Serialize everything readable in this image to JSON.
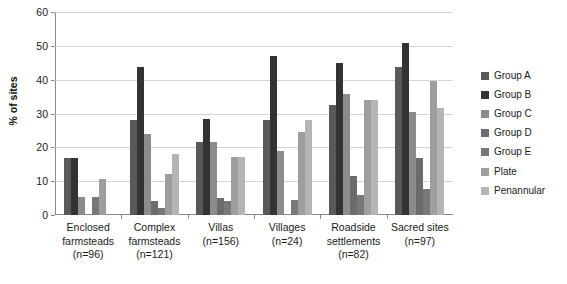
{
  "chart_data": {
    "type": "bar",
    "title": "",
    "subtitle": "",
    "xlabel": "",
    "ylabel": "% of sites",
    "ylim": [
      0,
      60
    ],
    "ytick_step": 10,
    "yticks": [
      0,
      10,
      20,
      30,
      40,
      50,
      60
    ],
    "grid": "horizontal",
    "legend_position": "right",
    "categories": [
      "Enclosed farmsteads (n=96)",
      "Complex farmsteads (n=121)",
      "Villas (n=156)",
      "Villages (n=24)",
      "Roadside settlements (n=82)",
      "Sacred sites (n=97)"
    ],
    "category_lines": [
      [
        "Enclosed",
        "farmsteads",
        "(n=96)"
      ],
      [
        "Complex",
        "farmsteads",
        "(n=121)"
      ],
      [
        "Villas",
        "(n=156)"
      ],
      [
        "Villages",
        "(n=24)"
      ],
      [
        "Roadside",
        "settlements",
        "(n=82)"
      ],
      [
        "Sacred sites",
        "(n=97)"
      ]
    ],
    "series": [
      {
        "name": "Group A",
        "color": "#595959",
        "values": [
          16.8,
          28.0,
          21.5,
          28.0,
          32.5,
          43.8
        ]
      },
      {
        "name": "Group B",
        "color": "#333333",
        "values": [
          16.8,
          43.8,
          28.5,
          47.0,
          45.0,
          50.8
        ]
      },
      {
        "name": "Group C",
        "color": "#8c8c8c",
        "values": [
          5.2,
          24.0,
          21.5,
          18.8,
          35.8,
          30.5
        ]
      },
      {
        "name": "Group D",
        "color": "#6b6b6b",
        "values": [
          0.0,
          4.1,
          5.1,
          0.0,
          11.5,
          16.8
        ]
      },
      {
        "name": "Group E",
        "color": "#787878",
        "values": [
          5.2,
          2.1,
          4.2,
          4.5,
          6.0,
          7.8
        ]
      },
      {
        "name": "Plate",
        "color": "#9e9e9e",
        "values": [
          10.5,
          12.2,
          17.0,
          24.5,
          34.0,
          39.5
        ]
      },
      {
        "name": "Penannular",
        "color": "#b5b5b5",
        "values": [
          0.0,
          18.0,
          17.0,
          28.0,
          34.0,
          31.5
        ]
      }
    ]
  },
  "legend": {
    "items": [
      {
        "label": "Group A",
        "color": "#595959"
      },
      {
        "label": "Group B",
        "color": "#333333"
      },
      {
        "label": "Group C",
        "color": "#8c8c8c"
      },
      {
        "label": "Group D",
        "color": "#6b6b6b"
      },
      {
        "label": "Group E",
        "color": "#787878"
      },
      {
        "label": "Plate",
        "color": "#9e9e9e"
      },
      {
        "label": "Penannular",
        "color": "#b5b5b5"
      }
    ]
  },
  "caption": {
    "text": ""
  }
}
